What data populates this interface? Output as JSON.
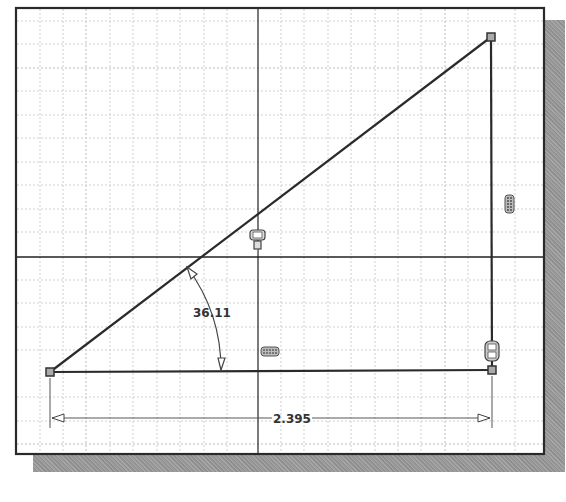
{
  "sketch": {
    "grid": {
      "minor_spacing_px": 23.4,
      "color": "#c8c8c8"
    },
    "axes": {
      "x_axis_y": 257,
      "y_axis_x": 258,
      "color": "#222222"
    },
    "triangle": {
      "vertices": {
        "bottom_left": [
          50,
          372
        ],
        "bottom_right": [
          492,
          370
        ],
        "top_right": [
          491,
          37
        ]
      },
      "line_color": "#2a2a2a"
    },
    "dimensions": {
      "angle": {
        "value": "36.11",
        "label_pos": [
          196,
          317
        ]
      },
      "horizontal": {
        "value": "2.395",
        "label_pos": [
          292,
          423
        ],
        "line_y": 418
      }
    },
    "constraints": [
      {
        "type": "coincident",
        "icon": "coincident-constraint-icon",
        "pos": [
          258,
          241
        ]
      },
      {
        "type": "horizontal",
        "icon": "horizontal-constraint-icon",
        "pos": [
          270,
          352
        ]
      },
      {
        "type": "vertical",
        "icon": "vertical-constraint-icon",
        "pos": [
          510,
          204
        ]
      },
      {
        "type": "perpendicular",
        "icon": "perpendicular-constraint-icon",
        "pos": [
          492,
          352
        ]
      }
    ]
  }
}
